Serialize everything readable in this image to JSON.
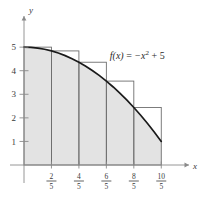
{
  "figure": {
    "title": "",
    "function_label": "f(x) = −x² + 5",
    "function_parts": {
      "fx": "f",
      "of_x": "(x)",
      "equals": "=",
      "neg_x": "−x",
      "exponent": "2",
      "plus_five": "+ 5"
    },
    "axis_x_label": "x",
    "axis_y_label": "y",
    "colors": {
      "fill": "#e3e3e3",
      "curve": "#1a1a1a",
      "rect_stroke": "#6e6e6e",
      "axis": "#8a8a8a",
      "text": "#3a3a3a"
    }
  },
  "chart_data": {
    "type": "area",
    "title": "",
    "subtitle": "",
    "xlabel": "x",
    "ylabel": "y",
    "xlim": [
      0,
      2.2
    ],
    "ylim": [
      0,
      5.6
    ],
    "grid": false,
    "legend": null,
    "function": "f(x) = -x^2 + 5",
    "interval": [
      0,
      2
    ],
    "n_rectangles": 5,
    "rectangle_width": 0.4,
    "sum_type": "circumscribed-upper-riemann-sum",
    "sample_point": "left-endpoint",
    "annotations": [
      {
        "text": "f(x) = −x² + 5",
        "x": 1.25,
        "y": 4.5
      }
    ],
    "x_ticks": [
      {
        "value": 0.4,
        "label_num": "2",
        "label_den": "5"
      },
      {
        "value": 0.8,
        "label_num": "4",
        "label_den": "5"
      },
      {
        "value": 1.2,
        "label_num": "6",
        "label_den": "5"
      },
      {
        "value": 1.6,
        "label_num": "8",
        "label_den": "5"
      },
      {
        "value": 2.0,
        "label_num": "10",
        "label_den": "5"
      }
    ],
    "y_ticks": [
      {
        "value": 1,
        "label": "1"
      },
      {
        "value": 2,
        "label": "2"
      },
      {
        "value": 3,
        "label": "3"
      },
      {
        "value": 4,
        "label": "4"
      },
      {
        "value": 5,
        "label": "5"
      }
    ],
    "rectangles": [
      {
        "x_left": 0.0,
        "x_right": 0.4,
        "height": 5.0
      },
      {
        "x_left": 0.4,
        "x_right": 0.8,
        "height": 4.84
      },
      {
        "x_left": 0.8,
        "x_right": 1.2,
        "height": 4.36
      },
      {
        "x_left": 1.2,
        "x_right": 1.6,
        "height": 3.56
      },
      {
        "x_left": 1.6,
        "x_right": 2.0,
        "height": 2.44
      }
    ],
    "curve": {
      "x": [
        0.0,
        0.1,
        0.2,
        0.3,
        0.4,
        0.5,
        0.6,
        0.7,
        0.8,
        0.9,
        1.0,
        1.1,
        1.2,
        1.3,
        1.4,
        1.5,
        1.6,
        1.7,
        1.8,
        1.9,
        2.0
      ],
      "y": [
        5.0,
        4.99,
        4.96,
        4.91,
        4.84,
        4.75,
        4.64,
        4.51,
        4.36,
        4.19,
        4.0,
        3.79,
        3.56,
        3.31,
        3.04,
        2.75,
        2.44,
        2.11,
        1.76,
        1.39,
        1.0
      ]
    }
  }
}
